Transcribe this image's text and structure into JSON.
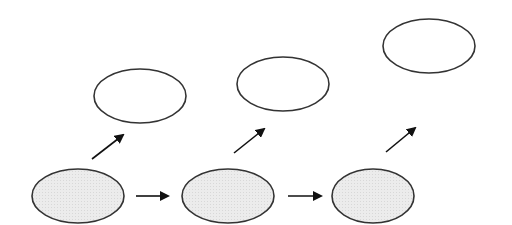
{
  "diagram": {
    "type": "flow-diagram",
    "colors": {
      "stroke": "#333333",
      "filled_node": "#e9e9e9",
      "empty_node": "#ffffff",
      "arrow": "#111111",
      "background": "#ffffff"
    },
    "nodes": [
      {
        "id": "bottom-1",
        "filled": true,
        "cx": 78,
        "cy": 196,
        "rx": 46,
        "ry": 27
      },
      {
        "id": "bottom-2",
        "filled": true,
        "cx": 228,
        "cy": 196,
        "rx": 46,
        "ry": 27
      },
      {
        "id": "bottom-3",
        "filled": true,
        "cx": 373,
        "cy": 196,
        "rx": 41,
        "ry": 27
      },
      {
        "id": "top-1",
        "filled": false,
        "cx": 140,
        "cy": 96,
        "rx": 46,
        "ry": 27
      },
      {
        "id": "top-2",
        "filled": false,
        "cx": 283,
        "cy": 84,
        "rx": 46,
        "ry": 27
      },
      {
        "id": "top-3",
        "filled": false,
        "cx": 429,
        "cy": 46,
        "rx": 46,
        "ry": 27
      }
    ],
    "edges": [
      {
        "from": "bottom-1",
        "to": "bottom-2",
        "x1": 136,
        "y1": 196,
        "x2": 168,
        "y2": 196
      },
      {
        "from": "bottom-2",
        "to": "bottom-3",
        "x1": 288,
        "y1": 196,
        "x2": 321,
        "y2": 196
      },
      {
        "from": "bottom-1",
        "to": "top-1",
        "x1": 92,
        "y1": 159,
        "x2": 123,
        "y2": 135
      },
      {
        "from": "bottom-2",
        "to": "top-2",
        "x1": 234,
        "y1": 153,
        "x2": 264,
        "y2": 129
      },
      {
        "from": "bottom-3",
        "to": "top-3",
        "x1": 386,
        "y1": 152,
        "x2": 415,
        "y2": 128
      }
    ]
  }
}
